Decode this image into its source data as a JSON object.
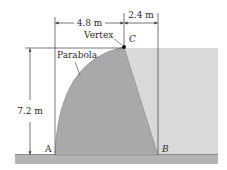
{
  "diagram": {
    "type": "dam-cross-section",
    "labels": {
      "vertex": "Vertex",
      "parabola": "Parabola",
      "point_c": "C",
      "point_a": "A",
      "point_b": "B"
    },
    "dimensions": {
      "width_left": "4.8 m",
      "width_right": "2.4 m",
      "height": "7.2 m"
    },
    "colors": {
      "dam": "#a9a9a9",
      "water": "#d9d9d9",
      "ground": "#b3b3b3",
      "ground_edge": "#8a8a8a",
      "lines": "#3a3a3a",
      "vertex_dot": "#111111"
    }
  }
}
